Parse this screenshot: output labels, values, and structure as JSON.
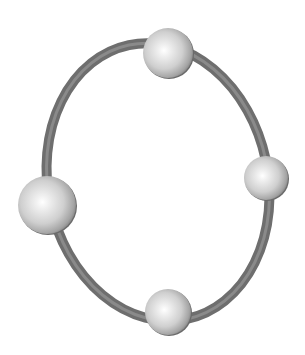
{
  "diagram": {
    "type": "ring-with-nodes",
    "background": "#ffffff",
    "ring": {
      "color": "#6e6e6e",
      "highlight": "#8a8a8a",
      "thickness": 10,
      "cx": 158,
      "cy": 182,
      "rx": 110,
      "ry": 140,
      "rotation": -12
    },
    "nodes": [
      {
        "id": "top",
        "cx": 168,
        "cy": 53,
        "r": 25
      },
      {
        "id": "right",
        "cx": 266,
        "cy": 178,
        "r": 22
      },
      {
        "id": "left",
        "cx": 47,
        "cy": 205,
        "r": 29
      },
      {
        "id": "bottom",
        "cx": 168,
        "cy": 312,
        "r": 23
      }
    ],
    "node_colors": {
      "light": "#fafafa",
      "mid": "#d6d6d6",
      "dark": "#8c8c8c",
      "edge": "#6a6a6a"
    }
  }
}
